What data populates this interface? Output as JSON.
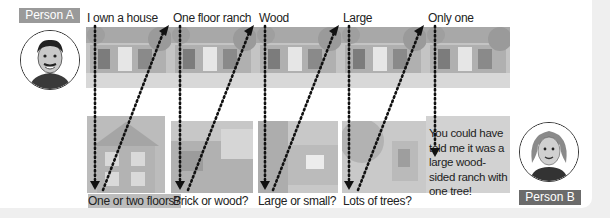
{
  "person_a": {
    "label": "Person A",
    "avatar": "man-avatar-icon"
  },
  "person_b": {
    "label": "Person B",
    "avatar": "woman-avatar-icon"
  },
  "statements": [
    {
      "text": "I own a house",
      "x": 87
    },
    {
      "text": "One floor ranch",
      "x": 173
    },
    {
      "text": "Wood",
      "x": 259
    },
    {
      "text": "Large",
      "x": 343
    },
    {
      "text": "Only one",
      "x": 428
    }
  ],
  "questions": [
    {
      "text": "One or two floors?",
      "x": 88
    },
    {
      "text": "Brick or wood?",
      "x": 173
    },
    {
      "text": "Large or small?",
      "x": 258
    },
    {
      "text": "Lots of trees?",
      "x": 343
    }
  ],
  "conclusion": "You could have told me it was a large wood-sided ranch with one tree!",
  "colors": {
    "background": "#efefef",
    "card": "#ffffff",
    "tag_a": "#9a9a9a",
    "tag_b": "#6b6b6b",
    "arrow": "#111111",
    "photo": "#bdbdbd"
  },
  "arrow_icon": "dotted-arrow-icon"
}
